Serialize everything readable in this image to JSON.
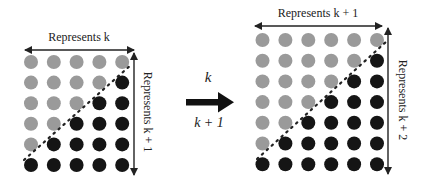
{
  "colors": {
    "gray_dot": "#9a9a9a",
    "black_dot": "#151515",
    "line": "#222222"
  },
  "left_panel": {
    "top_label": "Represents k",
    "side_label": "Represents k + 1",
    "columns": 5,
    "rows": 6,
    "grid": [
      [
        "g",
        "g",
        "g",
        "g",
        "g"
      ],
      [
        "g",
        "g",
        "g",
        "g",
        "b"
      ],
      [
        "g",
        "g",
        "g",
        "b",
        "b"
      ],
      [
        "g",
        "g",
        "b",
        "b",
        "b"
      ],
      [
        "g",
        "b",
        "b",
        "b",
        "b"
      ],
      [
        "b",
        "b",
        "b",
        "b",
        "b"
      ]
    ]
  },
  "middle": {
    "top_label": "k",
    "bottom_label": "k + 1",
    "arrow": "right-arrow"
  },
  "right_panel": {
    "top_label": "Represents k + 1",
    "side_label": "Represents k + 2",
    "columns": 6,
    "rows": 7,
    "grid": [
      [
        "g",
        "g",
        "g",
        "g",
        "g",
        "g"
      ],
      [
        "g",
        "g",
        "g",
        "g",
        "g",
        "b"
      ],
      [
        "g",
        "g",
        "g",
        "g",
        "b",
        "b"
      ],
      [
        "g",
        "g",
        "g",
        "b",
        "b",
        "b"
      ],
      [
        "g",
        "g",
        "b",
        "b",
        "b",
        "b"
      ],
      [
        "g",
        "b",
        "b",
        "b",
        "b",
        "b"
      ],
      [
        "b",
        "b",
        "b",
        "b",
        "b",
        "b"
      ]
    ]
  }
}
